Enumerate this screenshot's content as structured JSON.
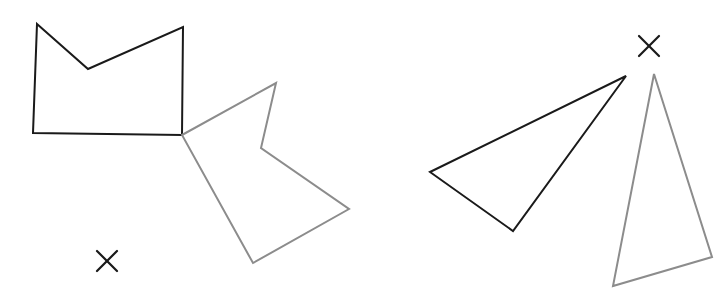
{
  "diagram": {
    "canvas": {
      "width": 725,
      "height": 302,
      "background": "#ffffff"
    },
    "colors": {
      "original": "#1a1a1a",
      "image": "#8c8c8c"
    },
    "stroke_width": 2,
    "figures": [
      {
        "id": "polygon-original",
        "role": "original",
        "kind": "pentagon",
        "points": [
          [
            37,
            24
          ],
          [
            88,
            69
          ],
          [
            183,
            27
          ],
          [
            182,
            135
          ],
          [
            33,
            133
          ]
        ]
      },
      {
        "id": "polygon-image",
        "role": "image",
        "kind": "pentagon",
        "points": [
          [
            182,
            135
          ],
          [
            276,
            83
          ],
          [
            261,
            148
          ],
          [
            349,
            209
          ],
          [
            253,
            263
          ]
        ]
      },
      {
        "id": "triangle-original",
        "role": "original",
        "kind": "triangle",
        "points": [
          [
            430,
            172
          ],
          [
            626,
            76
          ],
          [
            513,
            231
          ]
        ]
      },
      {
        "id": "triangle-image",
        "role": "image",
        "kind": "triangle",
        "points": [
          [
            654,
            74
          ],
          [
            712,
            257
          ],
          [
            613,
            286
          ]
        ]
      }
    ],
    "markers": [
      {
        "id": "center-left",
        "symbol": "×",
        "x": 107,
        "y": 261,
        "size": 10
      },
      {
        "id": "center-right",
        "symbol": "×",
        "x": 649,
        "y": 46,
        "size": 10
      }
    ]
  }
}
